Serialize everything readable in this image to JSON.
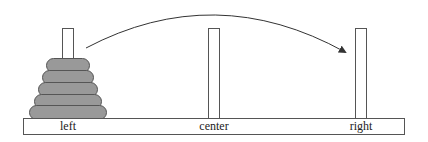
{
  "diagram": {
    "pegs": [
      {
        "id": "left",
        "label": "left",
        "x": 62
      },
      {
        "id": "center",
        "label": "center",
        "x": 208
      },
      {
        "id": "right",
        "label": "right",
        "x": 355
      }
    ],
    "disks": [
      {
        "peg": "left",
        "size": 1,
        "width": 44,
        "top": 58
      },
      {
        "peg": "left",
        "size": 2,
        "width": 52,
        "top": 71
      },
      {
        "peg": "left",
        "size": 3,
        "width": 60,
        "top": 84
      },
      {
        "peg": "left",
        "size": 4,
        "width": 68,
        "top": 97
      },
      {
        "peg": "left",
        "size": 5,
        "width": 78,
        "top": 104
      }
    ],
    "arrow": {
      "from": "left",
      "to": "right"
    },
    "colors": {
      "disk_fill": "#999999",
      "stroke": "#555555",
      "background": "#ffffff"
    }
  }
}
